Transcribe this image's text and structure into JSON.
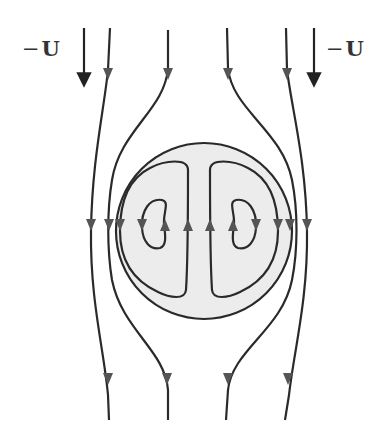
{
  "figure": {
    "type": "streamline-diagram",
    "labels": {
      "left_velocity": {
        "sign": "−",
        "symbol": "U"
      },
      "right_velocity": {
        "sign": "−",
        "symbol": "U"
      }
    },
    "sphere": {
      "cx": 204,
      "cy": 231,
      "r": 88,
      "fill": "#ececec",
      "stroke": "#2a2a2a"
    },
    "colors": {
      "line": "#2a2a2a",
      "arrow": "#555555",
      "background": "#ffffff"
    },
    "flow_direction": "downward outside, recirculating inside",
    "external_streamlines": 4,
    "internal_vortex_rings": 2
  }
}
